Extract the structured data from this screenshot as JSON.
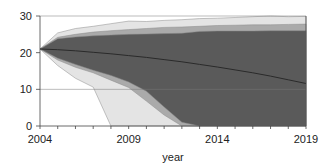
{
  "chart_data": {
    "type": "area",
    "title": "",
    "xlabel": "year",
    "ylabel": "",
    "xlim": [
      2004,
      2019
    ],
    "ylim": [
      0,
      30
    ],
    "x_ticks": [
      2004,
      2009,
      2014,
      2019
    ],
    "y_ticks": [
      0,
      10,
      20,
      30
    ],
    "grid": false,
    "legend": null,
    "x": [
      2004,
      2005,
      2006,
      2007,
      2008,
      2009,
      2010,
      2011,
      2012,
      2013,
      2014,
      2015,
      2016,
      2017,
      2018,
      2019
    ],
    "central_line": [
      21,
      20.8,
      20.5,
      20.1,
      19.7,
      19.2,
      18.7,
      18.1,
      17.5,
      16.8,
      16.1,
      15.3,
      14.5,
      13.6,
      12.6,
      11.6
    ],
    "series": [
      {
        "name": "outer band",
        "color": "#e4e4e4",
        "upper": [
          21,
          25.4,
          26.6,
          27.2,
          27.9,
          28.6,
          28.5,
          28.8,
          29.0,
          29.3,
          29.4,
          29.6,
          29.8,
          30.0,
          29.8,
          29.9
        ],
        "lower": [
          21,
          16.5,
          13,
          10.6,
          0,
          0,
          0,
          0,
          0,
          0,
          0,
          0,
          0,
          0,
          0,
          0
        ]
      },
      {
        "name": "middle band",
        "color": "#aaaaaa",
        "upper": [
          21,
          24.2,
          25.0,
          25.6,
          26.0,
          26.3,
          26.6,
          26.9,
          27.0,
          27.2,
          27.4,
          27.5,
          27.6,
          27.6,
          27.7,
          27.8
        ],
        "lower": [
          21,
          18.0,
          16.0,
          14.5,
          12.5,
          10.5,
          6.8,
          3.0,
          0,
          0,
          0,
          0,
          0,
          0,
          0,
          0
        ]
      },
      {
        "name": "inner band",
        "color": "#5a5a5a",
        "upper": [
          21,
          23.8,
          24.3,
          24.6,
          24.8,
          25.0,
          25.1,
          25.2,
          25.3,
          25.8,
          25.9,
          25.9,
          25.9,
          26.0,
          26.0,
          26.0
        ],
        "lower": [
          21,
          18.5,
          16.8,
          15.2,
          13.8,
          12.0,
          9.5,
          5.2,
          1.0,
          0,
          0,
          0,
          0,
          0,
          0,
          0
        ]
      }
    ]
  }
}
